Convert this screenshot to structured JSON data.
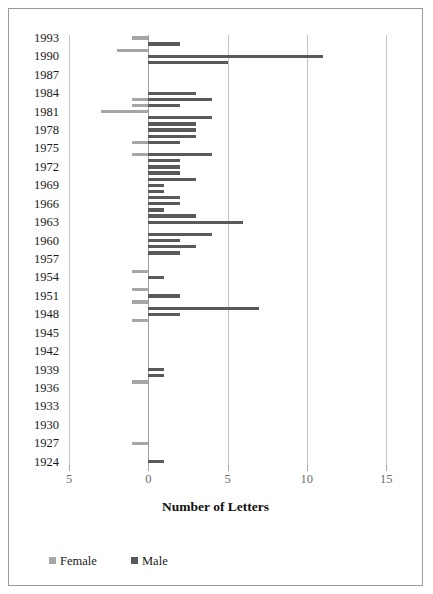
{
  "chart_data": {
    "type": "bar",
    "orientation": "horizontal",
    "style": "diverging-tornado",
    "title": "",
    "xlabel": "Number of Letters",
    "ylabel": "",
    "xlim": [
      -5,
      16
    ],
    "xticks": [
      -5,
      0,
      5,
      10,
      15
    ],
    "xtick_labels": [
      "5",
      "0",
      "5",
      "10",
      "15"
    ],
    "grid": true,
    "grid_axis": "x",
    "legend": [
      "Female",
      "Male"
    ],
    "legend_position": "bottom-left",
    "colors": {
      "female": "#a6a6a6",
      "male": "#595959",
      "grid": "#c4c4c4",
      "axis": "#9d9d9d",
      "border": "#9a9a9a"
    },
    "categories": [
      1993,
      1992,
      1991,
      1990,
      1989,
      1988,
      1987,
      1986,
      1985,
      1984,
      1983,
      1982,
      1981,
      1980,
      1979,
      1978,
      1977,
      1976,
      1975,
      1974,
      1973,
      1972,
      1971,
      1970,
      1969,
      1968,
      1967,
      1966,
      1965,
      1964,
      1963,
      1962,
      1961,
      1960,
      1959,
      1958,
      1957,
      1956,
      1955,
      1954,
      1953,
      1952,
      1951,
      1950,
      1949,
      1948,
      1947,
      1946,
      1945,
      1944,
      1943,
      1942,
      1941,
      1940,
      1939,
      1938,
      1937,
      1936,
      1935,
      1934,
      1933,
      1932,
      1931,
      1930,
      1929,
      1928,
      1927,
      1926,
      1925,
      1924
    ],
    "ytick_labels": [
      "1993",
      "1990",
      "1987",
      "1984",
      "1981",
      "1978",
      "1975",
      "1972",
      "1969",
      "1966",
      "1963",
      "1960",
      "1957",
      "1954",
      "1951",
      "1948",
      "1945",
      "1942",
      "1939",
      "1936",
      "1933",
      "1930",
      "1927",
      "1924"
    ],
    "series": [
      {
        "name": "Female",
        "color": "#a6a6a6",
        "note": "plotted as negative (extending left of zero)",
        "values": [
          1,
          0,
          2,
          0,
          0,
          0,
          0,
          0,
          0,
          0,
          1,
          1,
          3,
          0,
          0,
          0,
          0,
          1,
          0,
          1,
          0,
          0,
          0,
          0,
          0,
          0,
          0,
          0,
          0,
          0,
          0,
          0,
          0,
          0,
          0,
          0,
          0,
          0,
          1,
          0,
          0,
          1,
          0,
          1,
          0,
          0,
          1,
          0,
          0,
          0,
          0,
          0,
          0,
          0,
          0,
          0,
          1,
          0,
          0,
          0,
          0,
          0,
          0,
          0,
          0,
          0,
          1,
          0,
          0,
          0
        ]
      },
      {
        "name": "Male",
        "color": "#595959",
        "values": [
          0,
          2,
          0,
          11,
          5,
          0,
          0,
          0,
          0,
          3,
          4,
          2,
          0,
          4,
          3,
          3,
          3,
          2,
          0,
          4,
          2,
          2,
          2,
          3,
          1,
          1,
          2,
          2,
          1,
          3,
          6,
          0,
          4,
          2,
          3,
          2,
          0,
          0,
          0,
          1,
          0,
          0,
          2,
          0,
          7,
          2,
          0,
          0,
          0,
          0,
          0,
          0,
          0,
          0,
          1,
          1,
          0,
          0,
          0,
          0,
          0,
          0,
          0,
          0,
          0,
          0,
          0,
          0,
          0,
          1
        ]
      }
    ]
  },
  "axis": {
    "x_title": "Number of Letters"
  },
  "legend": {
    "female_label": "Female",
    "male_label": "Male"
  }
}
